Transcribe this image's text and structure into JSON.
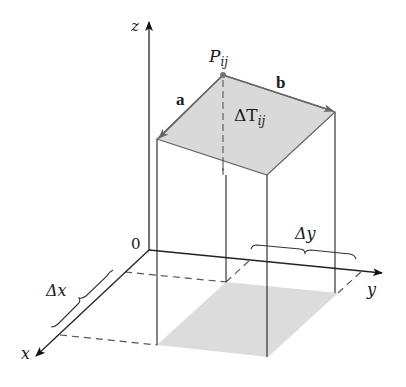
{
  "diagram": {
    "type": "3d-surface-area-element",
    "axes": {
      "x_label": "x",
      "y_label": "y",
      "z_label": "z",
      "origin_label": "0"
    },
    "point": {
      "label": "P",
      "subscript": "ij"
    },
    "vectors": [
      {
        "name": "a",
        "label": "a"
      },
      {
        "name": "b",
        "label": "b"
      }
    ],
    "tangent_patch": {
      "label": "ΔT",
      "subscript": "ij"
    },
    "increments": {
      "dx_label": "Δx",
      "dy_label": "Δy"
    },
    "colors": {
      "line": "#222222",
      "gray_line": "#666666",
      "patch_fill": "#d9d9d9",
      "base_fill": "#dcdcdc",
      "point": "#777777"
    }
  }
}
